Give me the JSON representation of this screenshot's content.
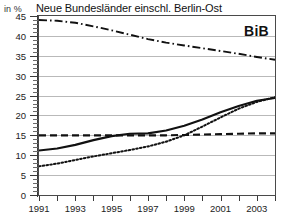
{
  "header": {
    "unit_label": "in %",
    "title": "Neue Bundesländer einschl. Berlin-Ost",
    "logo": "BiB"
  },
  "chart_data": {
    "type": "line",
    "title": "Neue Bundesländer einschl. Berlin-Ost",
    "xlabel": "",
    "ylabel": "in %",
    "ylim": [
      0,
      45
    ],
    "xlim": [
      1991,
      2004
    ],
    "ytick_step": 5,
    "yticks": [
      0,
      5,
      10,
      15,
      20,
      25,
      30,
      35,
      40,
      45
    ],
    "ytick_labels": [
      "0",
      "5",
      "10",
      "15",
      "20",
      "25",
      "30",
      "35",
      "40",
      "45"
    ],
    "x": [
      1991,
      1992,
      1993,
      1994,
      1995,
      1996,
      1997,
      1998,
      1999,
      2000,
      2001,
      2002,
      2003,
      2004
    ],
    "xticks": [
      1991,
      1992,
      1993,
      1994,
      1995,
      1996,
      1997,
      1998,
      1999,
      2000,
      2001,
      2002,
      2003,
      2004
    ],
    "xtick_labels": [
      "1991",
      "",
      "1993",
      "",
      "1995",
      "",
      "1997",
      "",
      "1999",
      "",
      "2001",
      "",
      "2003",
      ""
    ],
    "grid": true,
    "grid_axis": "y",
    "legend": "none",
    "series": [
      {
        "name": "series-dashdot",
        "style": "dash-dot",
        "color": "#111111",
        "values": [
          44.0,
          43.8,
          43.3,
          42.4,
          41.4,
          40.3,
          39.2,
          38.3,
          37.6,
          36.9,
          36.2,
          35.5,
          34.7,
          34.0
        ]
      },
      {
        "name": "series-dashed",
        "style": "dashed",
        "color": "#111111",
        "values": [
          15.0,
          15.0,
          15.0,
          15.0,
          15.0,
          15.0,
          15.0,
          15.0,
          15.1,
          15.2,
          15.3,
          15.4,
          15.5,
          15.5
        ]
      },
      {
        "name": "series-solid",
        "style": "solid",
        "color": "#111111",
        "values": [
          11.2,
          11.7,
          12.6,
          13.8,
          14.8,
          15.4,
          15.5,
          16.2,
          17.4,
          19.0,
          20.8,
          22.4,
          23.7,
          24.4
        ]
      },
      {
        "name": "series-dotted",
        "style": "dotted",
        "color": "#111111",
        "values": [
          7.2,
          7.9,
          8.8,
          9.7,
          10.5,
          11.3,
          12.2,
          13.4,
          15.0,
          17.2,
          19.5,
          21.7,
          23.4,
          24.6
        ]
      }
    ]
  }
}
